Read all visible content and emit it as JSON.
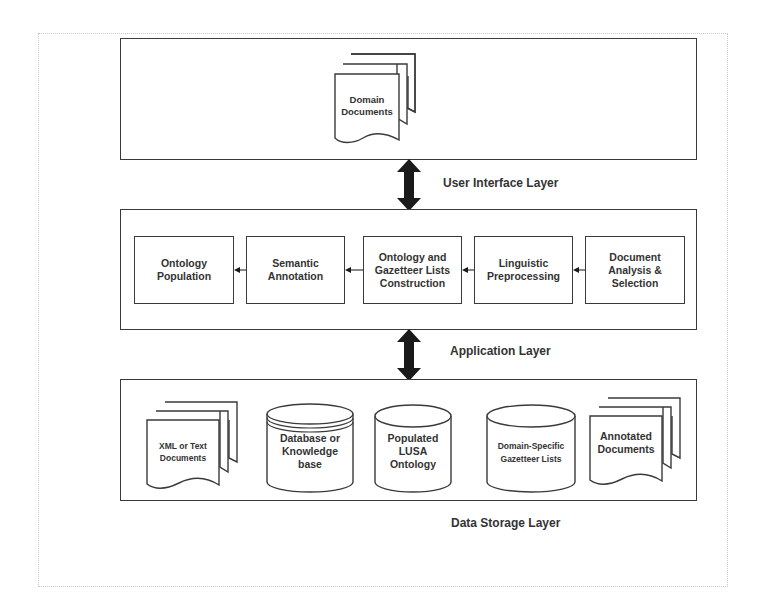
{
  "diagram": {
    "layers": [
      {
        "id": "ui",
        "label": "User Interface Layer",
        "items": [
          {
            "type": "document-stack",
            "label": "Domain\nDocuments"
          }
        ]
      },
      {
        "id": "app",
        "label": "Application Layer",
        "items": [
          {
            "type": "process",
            "label": "Ontology\nPopulation"
          },
          {
            "type": "process",
            "label": "Semantic\nAnnotation"
          },
          {
            "type": "process",
            "label": "Ontology and\nGazetteer Lists\nConstruction"
          },
          {
            "type": "process",
            "label": "Linguistic\nPreprocessing"
          },
          {
            "type": "process",
            "label": "Document\nAnalysis &\nSelection"
          }
        ],
        "flow": "right-to-left"
      },
      {
        "id": "storage",
        "label": "Data Storage Layer",
        "items": [
          {
            "type": "document-stack",
            "label": "XML or Text\nDocuments"
          },
          {
            "type": "cylinder",
            "label": "Database or\nKnowledge\nbase"
          },
          {
            "type": "cylinder",
            "label": "Populated\nLUSA\nOntology"
          },
          {
            "type": "cylinder",
            "label": "Domain-Specific\nGazetteer Lists"
          },
          {
            "type": "document-stack",
            "label": "Annotated\nDocuments"
          }
        ]
      }
    ],
    "connectors": [
      {
        "from": "ui",
        "to": "app",
        "type": "bidirectional-arrow"
      },
      {
        "from": "app",
        "to": "storage",
        "type": "bidirectional-arrow"
      }
    ],
    "colors": {
      "stroke": "#3a3a3a",
      "arrow_fill": "#1a1a1a",
      "background": "#ffffff",
      "frame": "#c8c8c8"
    }
  }
}
